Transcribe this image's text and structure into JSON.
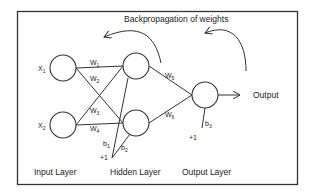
{
  "diagram": {
    "title": "Backpropagation of weights",
    "layers": [
      {
        "name": "Input Layer",
        "nodes": [
          {
            "label": "X",
            "sub": "1"
          },
          {
            "label": "X",
            "sub": "2"
          }
        ]
      },
      {
        "name": "Hidden Layer",
        "nodes": [
          {
            "label": ""
          },
          {
            "label": ""
          }
        ]
      },
      {
        "name": "Output Layer",
        "nodes": [
          {
            "label": ""
          }
        ]
      }
    ],
    "weights": [
      {
        "label": "W",
        "sub": "1"
      },
      {
        "label": "W",
        "sub": "2"
      },
      {
        "label": "W",
        "sub": "3"
      },
      {
        "label": "W",
        "sub": "4"
      },
      {
        "label": "W",
        "sub": "5"
      },
      {
        "label": "W",
        "sub": "6"
      }
    ],
    "biases": [
      {
        "label": "b",
        "sub": "1"
      },
      {
        "label": "b",
        "sub": "2"
      },
      {
        "label": "b",
        "sub": "3"
      }
    ],
    "bias_input_label": "+1",
    "output_label": "Output",
    "colors": {
      "stroke": "#333333",
      "background": "#ffffff",
      "text": "#222222"
    }
  }
}
